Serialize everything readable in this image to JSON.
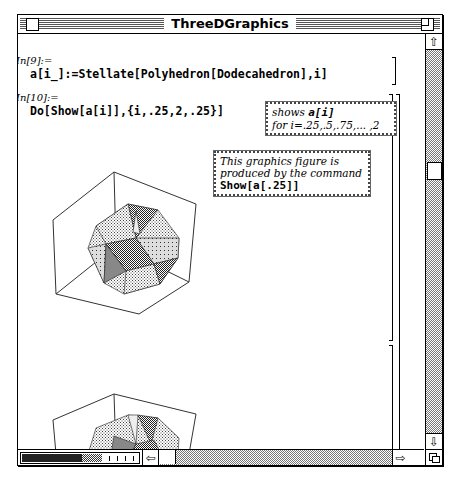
{
  "window": {
    "title": "ThreeDGraphics"
  },
  "cells": [
    {
      "label": "In[9]:=",
      "code": "a[i_]:=Stellate[Polyhedron[Dodecahedron],i]"
    },
    {
      "label": "In[10]:=",
      "code": "Do[Show[a[i]],{i,.25,2,.25}]"
    }
  ],
  "notes": {
    "shows": {
      "line1_italic": "shows ",
      "line1_code": "a[i]",
      "line2": "for i=.25,.5,.75,... ,2"
    },
    "figure": {
      "line1": "This graphics figure  is",
      "line2": "produced by the command",
      "code": "Show[a[.25]]"
    }
  },
  "graphics": [
    {
      "name": "stellated-dodecahedron-i-0.25"
    },
    {
      "name": "stellated-dodecahedron-i-0.5"
    }
  ],
  "icons": {
    "up_arrow": "⇧",
    "down_arrow": "⇩",
    "left_arrow": "⇦",
    "right_arrow": "⇨"
  }
}
